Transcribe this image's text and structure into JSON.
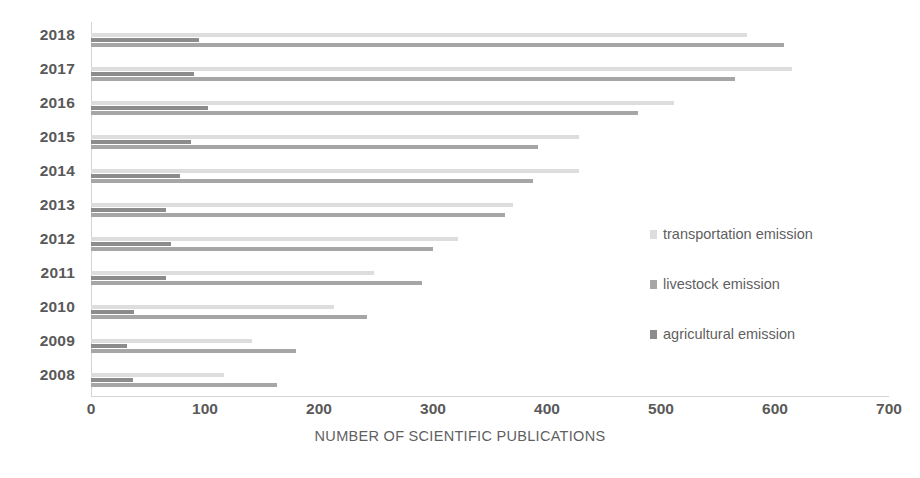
{
  "chart_data": {
    "type": "bar",
    "orientation": "horizontal",
    "title": "",
    "xlabel": "NUMBER OF SCIENTIFIC PUBLICATIONS",
    "ylabel": "",
    "xlim": [
      0,
      700
    ],
    "xticks": [
      0,
      100,
      200,
      300,
      400,
      500,
      600,
      700
    ],
    "xtick_labels": [
      "0",
      "100",
      "200",
      "300",
      "400",
      "500",
      "600",
      "700"
    ],
    "grid": false,
    "legend_position": "right-middle",
    "categories": [
      "2018",
      "2017",
      "2016",
      "2015",
      "2014",
      "2013",
      "2012",
      "2011",
      "2010",
      "2009",
      "2008"
    ],
    "series": [
      {
        "name": "transportation emission",
        "color": "#dddddd",
        "values": [
          575,
          615,
          511,
          428,
          428,
          370,
          322,
          248,
          213,
          141,
          117
        ]
      },
      {
        "name": "agricultural emission",
        "color": "#8c8c8c",
        "values": [
          95,
          90,
          103,
          88,
          78,
          66,
          70,
          66,
          38,
          32,
          37
        ]
      },
      {
        "name": "livestock emission",
        "color": "#a6a6a6",
        "values": [
          608,
          565,
          480,
          392,
          388,
          363,
          300,
          290,
          242,
          180,
          163
        ]
      }
    ]
  },
  "legend": {
    "items": [
      {
        "label": "transportation emission",
        "color": "#dddddd"
      },
      {
        "label": "livestock emission",
        "color": "#a6a6a6"
      },
      {
        "label": "agricultural emission",
        "color": "#8c8c8c"
      }
    ]
  }
}
